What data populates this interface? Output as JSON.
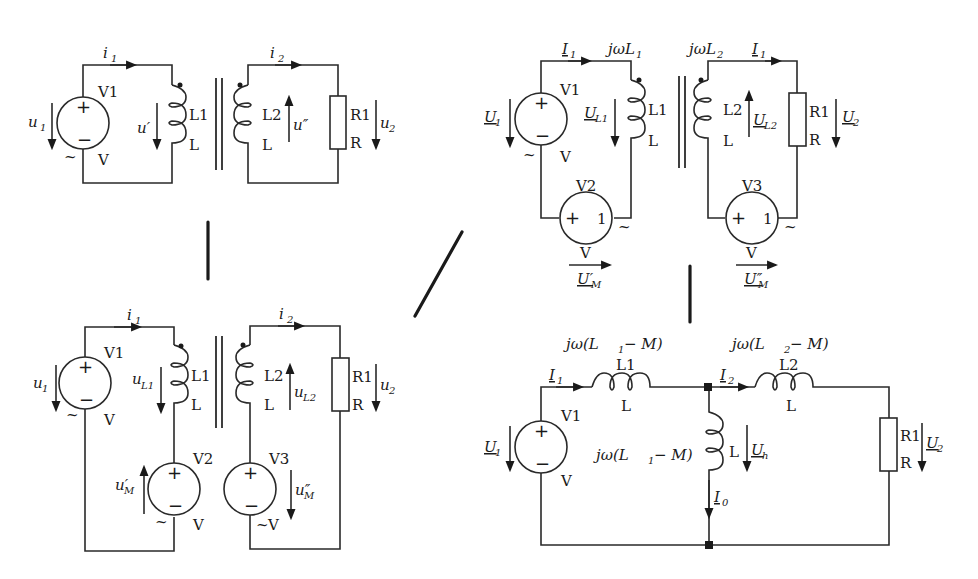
{
  "diagram": {
    "type": "circuit-transformation",
    "circuit_a": {
      "source": {
        "name": "V1",
        "unit": "V",
        "voltage": "u",
        "voltage_sub": "1",
        "tilde": "~"
      },
      "current1": {
        "sym": "i",
        "sub": "1"
      },
      "current2": {
        "sym": "i",
        "sub": "2"
      },
      "inductor1": {
        "name": "L1",
        "value": "L",
        "voltage": "u′"
      },
      "inductor2": {
        "name": "L2",
        "value": "L",
        "voltage": "u″"
      },
      "resistor": {
        "name": "R1",
        "value": "R",
        "voltage": "u",
        "voltage_sub": "2"
      }
    },
    "circuit_b": {
      "source1": {
        "name": "V1",
        "unit": "V",
        "voltage": "u",
        "voltage_sub": "1"
      },
      "source2": {
        "name": "V2",
        "unit": "V",
        "voltage": "u′",
        "voltage_sub": "M"
      },
      "source3": {
        "name": "V3",
        "unit": "V",
        "voltage": "u″",
        "voltage_sub": "M"
      },
      "current1": {
        "sym": "i",
        "sub": "1"
      },
      "current2": {
        "sym": "i",
        "sub": "2"
      },
      "inductor1": {
        "name": "L1",
        "value": "L",
        "voltage": "u",
        "voltage_sub": "L1"
      },
      "inductor2": {
        "name": "L2",
        "value": "L",
        "voltage": "u",
        "voltage_sub": "L2"
      },
      "resistor": {
        "name": "R1",
        "value": "R",
        "voltage": "u",
        "voltage_sub": "2"
      }
    },
    "circuit_c": {
      "source1": {
        "name": "V1",
        "unit": "V",
        "voltage": "U",
        "voltage_sub": "1"
      },
      "source2": {
        "name": "V2",
        "unit": "V",
        "voltage": "U′",
        "voltage_sub": "M"
      },
      "source3": {
        "name": "V3",
        "unit": "V",
        "voltage": "U″",
        "voltage_sub": "M"
      },
      "current1": {
        "sym": "I",
        "sub": "1"
      },
      "current2": {
        "sym": "I",
        "sub": "1"
      },
      "impedance1": "jωL",
      "impedance1_sub": "1",
      "impedance2": "jωL",
      "impedance2_sub": "2",
      "inductor1": {
        "name": "L1",
        "value": "L",
        "voltage": "U",
        "voltage_sub": "L1"
      },
      "inductor2": {
        "name": "L2",
        "value": "L",
        "voltage": "U",
        "voltage_sub": "L2"
      },
      "resistor": {
        "name": "R1",
        "value": "R",
        "voltage": "U",
        "voltage_sub": "2"
      }
    },
    "circuit_d": {
      "source": {
        "name": "V1",
        "unit": "V",
        "voltage": "U",
        "voltage_sub": "1"
      },
      "current1": {
        "sym": "I",
        "sub": "1"
      },
      "current2": {
        "sym": "I",
        "sub": "2"
      },
      "current0": {
        "sym": "I",
        "sub": "0"
      },
      "series1": {
        "name": "L1",
        "value": "L",
        "impedance_pre": "jω(L",
        "impedance_sub": "1",
        "impedance_post": " − M)"
      },
      "series2": {
        "name": "L2",
        "value": "L",
        "impedance_pre": "jω(L",
        "impedance_sub": "2",
        "impedance_post": " − M)"
      },
      "shunt": {
        "value": "L",
        "impedance_pre": "jω(L",
        "impedance_sub": "1",
        "impedance_post": " − M)",
        "voltage": "U",
        "voltage_sub": "h"
      },
      "resistor": {
        "name": "R1",
        "value": "R",
        "voltage": "U",
        "voltage_sub": "2"
      }
    },
    "signs": {
      "plus": "+",
      "minus": "−",
      "one": "1",
      "tilde": "~"
    }
  }
}
